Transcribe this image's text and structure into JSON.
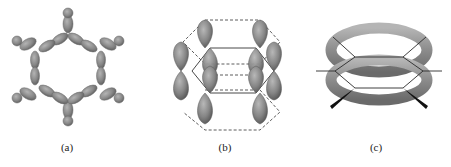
{
  "figure": {
    "panels": [
      {
        "id": "a",
        "label": "(a)",
        "description": "sigma-bond framework of benzene: sp2 hybrid orbitals forming hexagon with C-H bonds"
      },
      {
        "id": "b",
        "label": "(b)",
        "description": "six unhybridized p orbitals perpendicular to the ring plane, dashed hexagon outlines"
      },
      {
        "id": "c",
        "label": "(c)",
        "description": "delocalized pi-electron clouds as two toroidal rings above and below the hexagonal ring"
      }
    ],
    "colors": {
      "orbital_fill": "#8a8a8a",
      "orbital_dark": "#5e5e5e",
      "orbital_light": "#b0b0b0",
      "line": "#333333",
      "torus": "#9a9a9a",
      "background": "#ffffff"
    }
  }
}
